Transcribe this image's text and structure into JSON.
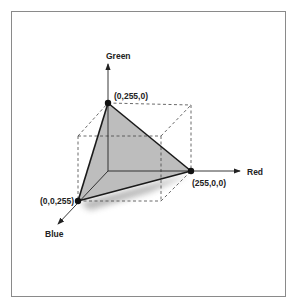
{
  "diagram": {
    "axes": {
      "red": "Red",
      "green": "Green",
      "blue": "Blue"
    },
    "vertices": {
      "green": "(0,255,0)",
      "red": "(255,0,0)",
      "blue": "(0,0,255)"
    },
    "colors": {
      "triangle_fill": "#bdbdbd",
      "line": "#1a1a1a",
      "frame": "#8a8a8a",
      "dashed": "#444444"
    }
  }
}
